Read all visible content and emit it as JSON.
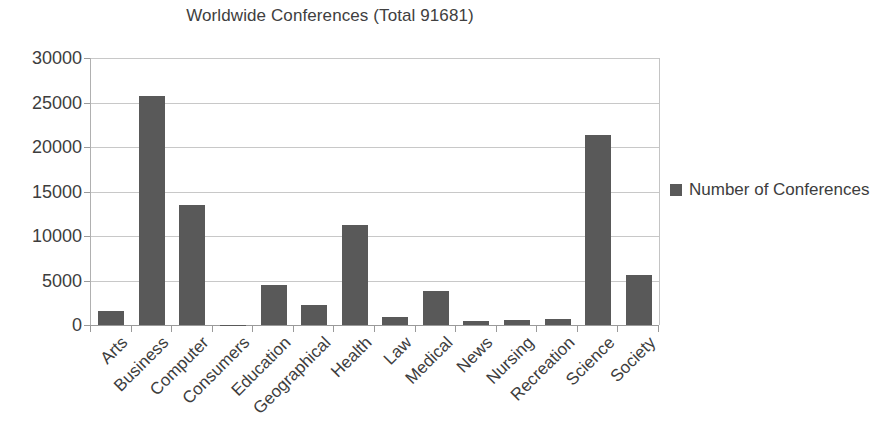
{
  "chart_data": {
    "type": "bar",
    "title": "Worldwide Conferences (Total 91681)",
    "xlabel": "",
    "ylabel": "",
    "categories": [
      "Arts",
      "Business",
      "Computer",
      "Consumers",
      "Education",
      "Geographical",
      "Health",
      "Law",
      "Medical",
      "News",
      "Nursing",
      "Recreation",
      "Science",
      "Society"
    ],
    "series": [
      {
        "name": "Number of Conferences",
        "values": [
          1600,
          25700,
          13500,
          50,
          4500,
          2300,
          11200,
          850,
          3800,
          400,
          600,
          700,
          21400,
          5600
        ]
      }
    ],
    "values": [
      1600,
      25700,
      13500,
      50,
      4500,
      2300,
      11200,
      850,
      3800,
      400,
      600,
      700,
      21400,
      5600
    ],
    "ylim": [
      0,
      30000
    ],
    "ytick_values": [
      0,
      5000,
      10000,
      15000,
      20000,
      25000,
      30000
    ],
    "ytick_labels": [
      "0",
      "5000",
      "10000",
      "15000",
      "20000",
      "25000",
      "30000"
    ],
    "grid": true,
    "legend_position": "right",
    "bar_color": "#595959",
    "gridline_color": "#c8c8c8",
    "axis_color": "#9a9a9a",
    "text_color": "#3d3d3d",
    "xtick_rotation": -45
  },
  "legend": {
    "entries": [
      {
        "label": "Number of Conferences",
        "color": "#595959",
        "marker": "square"
      }
    ]
  }
}
